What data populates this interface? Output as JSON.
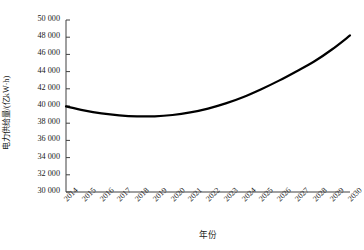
{
  "chart_data": {
    "type": "line",
    "title": "",
    "xlabel": "年份",
    "ylabel": "电力供给量/(亿kW·h)",
    "x": [
      2014,
      2015,
      2016,
      2017,
      2018,
      2019,
      2020,
      2021,
      2022,
      2023,
      2024,
      2025,
      2026,
      2027,
      2028,
      2029,
      2030
    ],
    "categories": [
      "2014",
      "2015",
      "2016",
      "2017",
      "2018",
      "2019",
      "2020",
      "2021",
      "2022",
      "2023",
      "2024",
      "2025",
      "2026",
      "2027",
      "2028",
      "2029",
      "2030"
    ],
    "values": [
      39950,
      39500,
      39150,
      38920,
      38800,
      38800,
      38950,
      39250,
      39700,
      40300,
      41050,
      41950,
      42950,
      44050,
      45200,
      46600,
      48200
    ],
    "series": [
      {
        "name": "电力供给量",
        "values": [
          39950,
          39500,
          39150,
          38920,
          38800,
          38800,
          38950,
          39250,
          39700,
          40300,
          41050,
          41950,
          42950,
          44050,
          45200,
          46600,
          48200
        ],
        "color": "#000000",
        "line_width": 2.2
      }
    ],
    "xlim": [
      2014,
      2030
    ],
    "ylim": [
      30000,
      50000
    ],
    "ytick_values": [
      50000,
      48000,
      46000,
      44000,
      42000,
      40000,
      38000,
      36000,
      34000,
      32000,
      30000
    ],
    "ytick_labels": [
      "50 000",
      "48 000",
      "46 000",
      "44 000",
      "42 000",
      "40 000",
      "38 000",
      "36 000",
      "34 000",
      "32 000",
      "30 000"
    ],
    "grid": false,
    "legend": null,
    "legend_position": "none",
    "axis_color": "#404040",
    "tick_direction": "in",
    "spines": [
      "left",
      "bottom"
    ],
    "xtick_rotation": -45
  }
}
